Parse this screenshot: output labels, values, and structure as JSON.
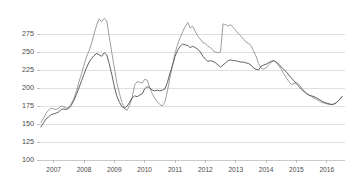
{
  "chart_data": {
    "type": "line",
    "title": "",
    "subtitle": "",
    "xlabel": "",
    "ylabel": "",
    "ylim": [
      100,
      300
    ],
    "xlim": [
      2006.55,
      2016.6
    ],
    "grid": true,
    "legend_position": "none",
    "y_ticks": [
      100,
      125,
      150,
      175,
      200,
      225,
      250,
      275
    ],
    "y_tick_labels": [
      "100",
      "125",
      "150",
      "175",
      "200",
      "225",
      "250",
      "275"
    ],
    "x_ticks": [
      2007,
      2008,
      2009,
      2010,
      2011,
      2012,
      2013,
      2014,
      2015,
      2016
    ],
    "x_tick_labels": [
      "2007",
      "2008",
      "2009",
      "2010",
      "2011",
      "2012",
      "2013",
      "2014",
      "2015",
      "2016"
    ],
    "colors": {
      "series_1": "#8c8c8c",
      "series_2": "#5a5a5a",
      "gridline": "#c9c9c9",
      "axis": "#b4b4b4",
      "text": "#4a4a4a",
      "background": "#ffffff"
    },
    "x": [
      2006.58,
      2006.67,
      2006.75,
      2006.83,
      2006.92,
      2007.0,
      2007.08,
      2007.17,
      2007.25,
      2007.33,
      2007.42,
      2007.5,
      2007.58,
      2007.67,
      2007.75,
      2007.83,
      2007.92,
      2008.0,
      2008.08,
      2008.17,
      2008.25,
      2008.33,
      2008.42,
      2008.5,
      2008.58,
      2008.67,
      2008.75,
      2008.83,
      2008.92,
      2009.0,
      2009.08,
      2009.17,
      2009.25,
      2009.33,
      2009.42,
      2009.5,
      2009.58,
      2009.67,
      2009.75,
      2009.83,
      2009.92,
      2010.0,
      2010.08,
      2010.17,
      2010.25,
      2010.33,
      2010.42,
      2010.5,
      2010.58,
      2010.67,
      2010.75,
      2010.83,
      2010.92,
      2011.0,
      2011.08,
      2011.17,
      2011.25,
      2011.33,
      2011.42,
      2011.5,
      2011.58,
      2011.67,
      2011.75,
      2011.83,
      2011.92,
      2012.0,
      2012.08,
      2012.17,
      2012.25,
      2012.33,
      2012.42,
      2012.5,
      2012.58,
      2012.67,
      2012.75,
      2012.83,
      2012.92,
      2013.0,
      2013.08,
      2013.17,
      2013.25,
      2013.33,
      2013.42,
      2013.5,
      2013.58,
      2013.67,
      2013.75,
      2013.83,
      2013.92,
      2014.0,
      2014.08,
      2014.17,
      2014.25,
      2014.33,
      2014.42,
      2014.5,
      2014.58,
      2014.67,
      2014.75,
      2014.83,
      2014.92,
      2015.0,
      2015.08,
      2015.17,
      2015.25,
      2015.33,
      2015.42,
      2015.5,
      2015.58,
      2015.67,
      2015.75,
      2015.83,
      2015.92,
      2016.0,
      2016.08,
      2016.17,
      2016.25,
      2016.33,
      2016.42,
      2016.5
    ],
    "series": [
      {
        "name": "Series 1",
        "color": "#8c8c8c",
        "values": [
          152,
          158,
          165,
          169,
          172,
          171,
          170,
          172,
          175,
          174,
          172,
          173,
          178,
          186,
          196,
          208,
          220,
          232,
          243,
          252,
          262,
          275,
          288,
          296,
          292,
          297,
          293,
          272,
          248,
          228,
          208,
          192,
          180,
          172,
          169,
          176,
          186,
          204,
          209,
          208,
          207,
          212,
          211,
          200,
          192,
          186,
          181,
          177,
          175,
          181,
          196,
          214,
          232,
          248,
          260,
          270,
          278,
          285,
          291,
          283,
          286,
          278,
          272,
          268,
          263,
          262,
          258,
          256,
          252,
          250,
          249,
          250,
          289,
          288,
          286,
          288,
          284,
          280,
          276,
          272,
          268,
          264,
          262,
          259,
          252,
          244,
          234,
          228,
          226,
          228,
          232,
          236,
          238,
          236,
          231,
          226,
          220,
          214,
          209,
          205,
          206,
          208,
          205,
          200,
          196,
          193,
          190,
          188,
          186,
          184,
          182,
          180,
          179,
          178,
          177,
          177,
          178,
          180,
          184,
          188
        ]
      },
      {
        "name": "Series 2",
        "color": "#5a5a5a",
        "values": [
          146,
          152,
          157,
          160,
          163,
          164,
          165,
          167,
          170,
          171,
          170,
          172,
          176,
          183,
          191,
          200,
          210,
          219,
          228,
          236,
          241,
          245,
          248,
          246,
          244,
          249,
          246,
          234,
          218,
          202,
          189,
          180,
          174,
          172,
          175,
          180,
          186,
          189,
          188,
          190,
          192,
          199,
          202,
          200,
          197,
          196,
          197,
          196,
          197,
          199,
          208,
          220,
          232,
          244,
          252,
          258,
          261,
          260,
          259,
          256,
          258,
          256,
          254,
          250,
          244,
          240,
          237,
          238,
          237,
          235,
          232,
          229,
          232,
          235,
          238,
          239,
          238,
          238,
          237,
          236,
          236,
          235,
          234,
          232,
          228,
          226,
          225,
          230,
          232,
          233,
          235,
          237,
          238,
          236,
          233,
          229,
          226,
          222,
          218,
          214,
          210,
          206,
          202,
          198,
          195,
          192,
          190,
          189,
          188,
          186,
          184,
          182,
          180,
          179,
          178,
          177,
          178,
          180,
          184,
          188
        ]
      }
    ]
  }
}
